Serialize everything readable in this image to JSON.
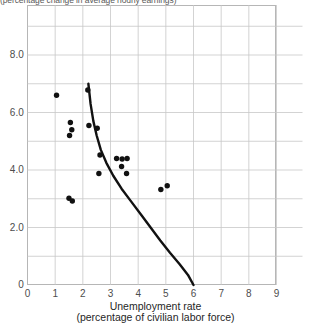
{
  "figure": {
    "top_clipped_title": "(percentage change in average hourly earnings)",
    "background_color": "#ffffff"
  },
  "axes": {
    "y_ticks": [
      "8.0",
      "6.0",
      "4.0",
      "2.0",
      "0"
    ],
    "x_ticks": [
      "0",
      "1",
      "2",
      "3",
      "4",
      "5",
      "6",
      "7",
      "8",
      "9"
    ],
    "x_label_line1": "Unemployment rate",
    "x_label_line2": "(percentage of civilian labor force)"
  },
  "chart_data": {
    "type": "scatter",
    "title": "",
    "xlabel": "Unemployment rate (percentage of civilian labor force)",
    "ylabel": "",
    "xlim": [
      0,
      9.5
    ],
    "ylim": [
      0,
      9.0
    ],
    "grid": true,
    "grid_x_step": 1,
    "grid_y_step": 1,
    "legend": "none",
    "marker_color": "#111111",
    "marker_size": 4.6,
    "curve_color": "#111111",
    "curve_width": 2.4,
    "series": [
      {
        "name": "Wage change vs unemployment",
        "points": [
          [
            1.05,
            6.6
          ],
          [
            1.55,
            5.65
          ],
          [
            1.6,
            5.4
          ],
          [
            1.52,
            5.2
          ],
          [
            1.5,
            3.02
          ],
          [
            1.62,
            2.92
          ],
          [
            2.18,
            6.78
          ],
          [
            2.22,
            5.55
          ],
          [
            2.52,
            5.45
          ],
          [
            2.62,
            4.52
          ],
          [
            2.58,
            3.88
          ],
          [
            3.22,
            4.4
          ],
          [
            3.42,
            4.38
          ],
          [
            3.6,
            4.4
          ],
          [
            3.4,
            4.12
          ],
          [
            3.58,
            3.88
          ],
          [
            4.82,
            3.32
          ],
          [
            5.05,
            3.45
          ]
        ]
      }
    ],
    "fitted_curve": {
      "name": "Phillips curve (fitted)",
      "description": "Downward-sloping convex curve from upper-left to lower-right",
      "points": [
        [
          2.2,
          7.0
        ],
        [
          2.28,
          6.3
        ],
        [
          2.38,
          5.7
        ],
        [
          2.5,
          5.2
        ],
        [
          2.65,
          4.7
        ],
        [
          2.85,
          4.25
        ],
        [
          3.1,
          3.8
        ],
        [
          3.4,
          3.35
        ],
        [
          3.75,
          2.9
        ],
        [
          4.1,
          2.45
        ],
        [
          4.45,
          2.0
        ],
        [
          4.8,
          1.55
        ],
        [
          5.15,
          1.12
        ],
        [
          5.5,
          0.72
        ],
        [
          5.8,
          0.35
        ],
        [
          6.0,
          0.0
        ]
      ]
    }
  }
}
